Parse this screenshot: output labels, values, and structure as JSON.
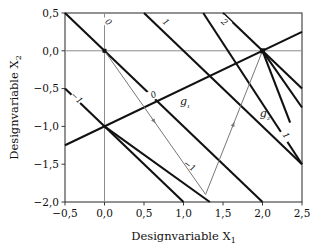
{
  "chart_data": {
    "type": "line",
    "title": "",
    "xlabel": "Designvariable X₁",
    "ylabel": "Designvariable X₂",
    "xlim": [
      -0.5,
      2.5
    ],
    "ylim": [
      -2.0,
      0.5
    ],
    "grid": false,
    "legend_position": "none",
    "xticks": [
      -0.5,
      0.0,
      0.5,
      1.0,
      1.5,
      2.0,
      2.5
    ],
    "xticklabels": [
      "−0,5",
      "0,0",
      "0,5",
      "1,0",
      "1,5",
      "2,0",
      "2,5"
    ],
    "yticks": [
      0.5,
      0.0,
      -0.5,
      -1.0,
      -1.5,
      -2.0
    ],
    "yticklabels": [
      "0,5",
      "0,0",
      "−0,5",
      "−1,0",
      "−1,5",
      "−2,0"
    ],
    "axis_lines": {
      "x_axis_at_y": 0.0,
      "y_axis_at_x": 0.0,
      "color": "#8c8c8c"
    },
    "series": [
      {
        "name": "objective-contour-0",
        "kind": "contour",
        "level": 0,
        "label": "0",
        "label_at": [
          0.05,
          0.38
        ],
        "points": [
          [
            -0.5,
            0.5
          ],
          [
            2.5,
            -2.5
          ]
        ],
        "color": "#111111",
        "width": 2.1
      },
      {
        "name": "objective-contour-minus1",
        "kind": "contour",
        "level": -1,
        "label": "−1",
        "label_at": [
          -0.35,
          -0.62
        ],
        "points": [
          [
            -0.5,
            -0.5
          ],
          [
            1.5,
            -2.5
          ]
        ],
        "color": "#111111",
        "width": 2.1
      },
      {
        "name": "objective-contour-1",
        "kind": "contour",
        "level": 1,
        "label": "1",
        "label_at": [
          0.78,
          0.38
        ],
        "points": [
          [
            0.5,
            0.5
          ],
          [
            2.5,
            -1.5
          ]
        ],
        "color": "#111111",
        "width": 2.1
      },
      {
        "name": "objective-contour-2",
        "kind": "contour",
        "level": 2,
        "label": "2",
        "label_at": [
          1.52,
          0.38
        ],
        "points": [
          [
            1.5,
            0.5
          ],
          [
            2.5,
            -0.5
          ]
        ],
        "color": "#111111",
        "width": 2.1
      },
      {
        "name": "constraint-g1-contour-0",
        "kind": "constraint",
        "level": 0,
        "label": "0",
        "label_at": [
          0.62,
          -0.58
        ],
        "points": [
          [
            -0.5,
            -1.25
          ],
          [
            2.5,
            0.25
          ]
        ],
        "color": "#111111",
        "width": 2.1
      },
      {
        "name": "constraint-g1-contour-minus1",
        "kind": "constraint",
        "level": "-1",
        "label": "−1",
        "label_at": [
          1.08,
          -1.52
        ],
        "points": [
          [
            0.0,
            -1.0
          ],
          [
            2.0,
            -2.5
          ]
        ],
        "color": "#111111",
        "width": 2.1
      },
      {
        "name": "constraint-g2-branch-a",
        "kind": "constraint",
        "level": 0,
        "label": "",
        "points": [
          [
            2.0,
            0.0
          ],
          [
            2.5,
            -0.75
          ]
        ],
        "color": "#111111",
        "width": 2.1
      },
      {
        "name": "constraint-g2-branch-b",
        "kind": "constraint",
        "level": 0,
        "label": "",
        "points": [
          [
            2.0,
            0.0
          ],
          [
            2.35,
            -0.95
          ]
        ],
        "color": "#111111",
        "width": 2.1
      },
      {
        "name": "constraint-g2-contour-1",
        "kind": "constraint",
        "level": 1,
        "label": "1",
        "label_at": [
          2.3,
          -1.12
        ],
        "points": [
          [
            1.25,
            0.5
          ],
          [
            2.5,
            -1.5
          ]
        ],
        "color": "#111111",
        "width": 2.1
      },
      {
        "name": "optimizer-iteration-path",
        "kind": "path",
        "label": "",
        "points": [
          [
            0.0,
            0.0
          ],
          [
            1.28,
            -1.9
          ],
          [
            2.0,
            0.0
          ]
        ],
        "color": "#777777",
        "width": 1.0,
        "arrows": true
      }
    ],
    "markers": [
      {
        "name": "start-point",
        "at": [
          0.0,
          0.0
        ],
        "shape": "square",
        "size": 4
      },
      {
        "name": "optimum-point",
        "at": [
          2.0,
          0.0
        ],
        "shape": "square",
        "size": 5
      }
    ],
    "annotations": [
      {
        "name": "g1-label",
        "text": "g₁",
        "at": [
          1.02,
          -0.72
        ]
      },
      {
        "name": "g2-label",
        "text": "g₂",
        "at": [
          2.03,
          -0.88
        ]
      }
    ]
  },
  "axis": {
    "xlabel": "Designvariable X",
    "xlabel_sub": "1",
    "ylabel": "Designvariable X",
    "ylabel_sub": "2"
  },
  "labels": {
    "g1": "g",
    "g1_sub": "1",
    "g2": "g",
    "g2_sub": "2"
  },
  "colors": {
    "frame": "#3a3a3a",
    "axis": "#8c8c8c",
    "line": "#111111",
    "path": "#777777",
    "background": "#ffffff"
  }
}
